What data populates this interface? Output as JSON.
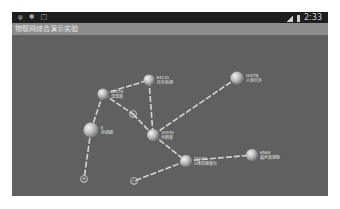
{
  "statusbar": {
    "left_icons": [
      "usb-icon",
      "android-debug-icon",
      "notification-box-icon"
    ],
    "time": "2:33"
  },
  "app": {
    "title": "物联网综合演示实验"
  },
  "topology": {
    "link_color": "#e8e8e8",
    "node_color": "#d8d8d8",
    "nodes": [
      {
        "id": "n10476",
        "addr": "10476",
        "name": "温湿度"
      },
      {
        "id": "n54131",
        "addr": "54131",
        "name": "红外检测"
      },
      {
        "id": "n10478",
        "addr": "10478",
        "name": "人体红外"
      },
      {
        "id": "n0",
        "addr": "0",
        "name": "协调器"
      },
      {
        "id": "n10354",
        "addr": "10354",
        "name": "光照度"
      },
      {
        "id": "n21023",
        "addr": "21023",
        "name": "3维加速度仪"
      },
      {
        "id": "n6568",
        "addr": "6568",
        "name": "超声波测距"
      }
    ],
    "small_nodes": [
      {
        "id": "s1",
        "label": "□"
      },
      {
        "id": "s2",
        "label": "□"
      },
      {
        "id": "s3",
        "label": "□"
      }
    ],
    "links": [
      {
        "from": "n10476",
        "to": "n54131"
      },
      {
        "from": "n54131",
        "to": "n10354"
      },
      {
        "from": "n10476",
        "to": "s1"
      },
      {
        "from": "s1",
        "to": "n10354"
      },
      {
        "from": "n10476",
        "to": "n0"
      },
      {
        "from": "n0",
        "to": "s2"
      },
      {
        "from": "n10354",
        "to": "n21023"
      },
      {
        "from": "n10354",
        "to": "n10478"
      },
      {
        "from": "n21023",
        "to": "n6568"
      },
      {
        "from": "n21023",
        "to": "s3"
      }
    ]
  }
}
